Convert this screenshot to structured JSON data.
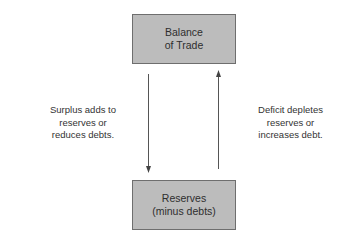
{
  "boxes": {
    "top": {
      "line1": "Balance",
      "line2": "of Trade"
    },
    "bottom": {
      "line1": "Reserves",
      "line2": "(minus debts)"
    }
  },
  "annotations": {
    "left": {
      "line1": "Surplus adds to",
      "line2": "reserves or",
      "line3": "reduces debts."
    },
    "right": {
      "line1": "Deficit depletes",
      "line2": "reserves or",
      "line3": "increases debt."
    }
  },
  "arrows": {
    "left": {
      "direction": "down",
      "from": "Balance of Trade",
      "to": "Reserves (minus debts)"
    },
    "right": {
      "direction": "up",
      "from": "Reserves (minus debts)",
      "to": "Balance of Trade"
    }
  },
  "colors": {
    "box_fill": "#bcbcbc",
    "box_border": "#6e6e6e",
    "arrow": "#555555"
  }
}
